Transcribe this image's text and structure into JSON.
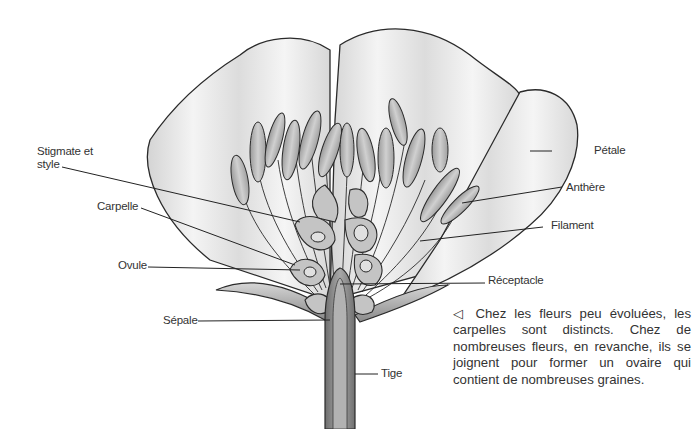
{
  "diagram": {
    "type": "botanical cross-section",
    "labels": {
      "stigmate_style": "Stigmate et style",
      "carpelle": "Carpelle",
      "ovule": "Ovule",
      "sepale": "Sépale",
      "petale": "Pétale",
      "anthere": "Anthère",
      "filament": "Filament",
      "receptacle": "Réceptacle",
      "tige": "Tige"
    },
    "caption": {
      "marker": "◁",
      "text": "Chez les fleurs peu évoluées, les carpelles sont distincts. Chez de nombreuses fleurs, en revanche, ils se joignent pour former un ovaire qui contient de nombreuses graines."
    },
    "colors": {
      "outline": "#2a2a2a",
      "petal_fill": "#e6e6e6",
      "stamen_fill": "#b9b9b9",
      "stem_fill": "#8c8c8c",
      "text": "#333333"
    }
  }
}
